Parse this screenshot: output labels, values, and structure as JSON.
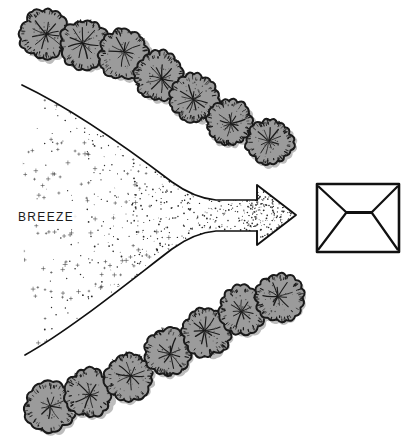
{
  "diagram": {
    "background_color": "#ffffff",
    "width": 419,
    "height": 446,
    "ink_color": "#111111",
    "tree_fill_color": "#9b9b9b",
    "tree_outline_color": "#1a1a1a",
    "tree_shadow_color": "#bdbdbd",
    "stipple_color": "#2b2b2b"
  },
  "labels": {
    "breeze": "BREEZE"
  },
  "breeze_arrow": {
    "name": "breeze-arrow",
    "description": "Stippled funnel narrowing into an arrow pointing right",
    "direction": "right",
    "fill_style": "stipple",
    "stipple_gradient": "sparse at left, dense at right",
    "tip_x": 295,
    "tip_y": 215
  },
  "building": {
    "name": "building-plan",
    "description": "Rectangle with hip-roof diagonals meeting an inner ridge line",
    "x": 317,
    "y": 184,
    "width": 82,
    "height": 68
  },
  "tree_rows": [
    {
      "name": "upper-tree-row",
      "count": 7,
      "direction": "descending-right",
      "trees": [
        {
          "cx": 45,
          "cy": 34,
          "r": 24
        },
        {
          "cx": 85,
          "cy": 44,
          "r": 24
        },
        {
          "cx": 124,
          "cy": 54,
          "r": 24
        },
        {
          "cx": 159,
          "cy": 76,
          "r": 23
        },
        {
          "cx": 194,
          "cy": 98,
          "r": 23
        },
        {
          "cx": 229,
          "cy": 123,
          "r": 22
        },
        {
          "cx": 270,
          "cy": 142,
          "r": 22
        }
      ]
    },
    {
      "name": "lower-tree-row",
      "count": 7,
      "direction": "ascending-right",
      "trees": [
        {
          "cx": 50,
          "cy": 407,
          "r": 24
        },
        {
          "cx": 89,
          "cy": 393,
          "r": 23
        },
        {
          "cx": 129,
          "cy": 377,
          "r": 23
        },
        {
          "cx": 168,
          "cy": 352,
          "r": 23
        },
        {
          "cx": 207,
          "cy": 332,
          "r": 23
        },
        {
          "cx": 243,
          "cy": 310,
          "r": 23
        },
        {
          "cx": 279,
          "cy": 298,
          "r": 23
        }
      ]
    }
  ]
}
